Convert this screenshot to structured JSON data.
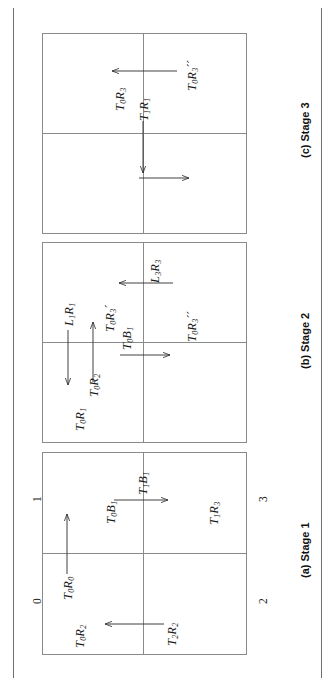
{
  "figure": {
    "type": "quadtree-stage-diagram",
    "orientation": "rotated-90-clockwise",
    "page_rules": 2,
    "panels": [
      {
        "id": "stage1",
        "caption": "(a) Stage 1",
        "quadrant_labels": [
          "0",
          "1",
          "2",
          "3"
        ],
        "cell_labels": [
          {
            "text_parts": [
              "T",
              "0",
              "R",
              "2"
            ],
            "display": "T0R2"
          },
          {
            "text_parts": [
              "T",
              "0",
              "B",
              "1"
            ],
            "display": "T0B1"
          },
          {
            "text_parts": [
              "T",
              "1",
              "R",
              "3"
            ],
            "display": "T1R3"
          }
        ],
        "arrow_labels": [
          {
            "display": "T0R0",
            "direction": "up"
          },
          {
            "display": "T1B1",
            "direction": "right"
          },
          {
            "display": "T2R2",
            "direction": "left"
          }
        ]
      },
      {
        "id": "stage2",
        "caption": "(b) Stage 2",
        "quadrant_labels": [],
        "cell_labels": [
          {
            "display": "T0R1"
          },
          {
            "display": "T0R3'"
          },
          {
            "display": "T0R3''"
          }
        ],
        "arrow_labels": [
          {
            "display": "L1R1",
            "direction": "down"
          },
          {
            "display": "T0R2",
            "direction": "up"
          },
          {
            "display": "T0B1",
            "direction": "right"
          },
          {
            "display": "L3R3",
            "direction": "left"
          }
        ]
      },
      {
        "id": "stage3",
        "caption": "(c) Stage 3",
        "quadrant_labels": [],
        "cell_labels": [
          {
            "display": "T0R3"
          },
          {
            "display": "T0R3''"
          }
        ],
        "arrow_labels": [
          {
            "display": "T1R1",
            "direction": "down-then-right"
          },
          {
            "display": "",
            "direction": "left"
          }
        ]
      }
    ]
  },
  "stage1": {
    "caption": "(a) Stage 1",
    "q0": "0",
    "q1": "1",
    "q2": "2",
    "q3": "3",
    "lbl_T0R2_T": "T",
    "lbl_T0R2_s1": "0",
    "lbl_T0R2_R": "R",
    "lbl_T0R2_s2": "2",
    "lbl_T0B1_T": "T",
    "lbl_T0B1_s1": "0",
    "lbl_T0B1_B": "B",
    "lbl_T0B1_s2": "1",
    "lbl_T1R3_T": "T",
    "lbl_T1R3_s1": "1",
    "lbl_T1R3_R": "R",
    "lbl_T1R3_s2": "3",
    "lbl_T0R0_T": "T",
    "lbl_T0R0_s1": "0",
    "lbl_T0R0_R": "R",
    "lbl_T0R0_s2": "0",
    "lbl_T1B1_T": "T",
    "lbl_T1B1_s1": "1",
    "lbl_T1B1_B": "B",
    "lbl_T1B1_s2": "1",
    "lbl_T2R2_T": "T",
    "lbl_T2R2_s1": "2",
    "lbl_T2R2_R": "R",
    "lbl_T2R2_s2": "2"
  },
  "stage2": {
    "caption": "(b) Stage 2",
    "lbl_T0R1_T": "T",
    "lbl_T0R1_s1": "0",
    "lbl_T0R1_R": "R",
    "lbl_T0R1_s2": "1",
    "lbl_L1R1_L": "L",
    "lbl_L1R1_s1": "1",
    "lbl_L1R1_R": "R",
    "lbl_L1R1_s2": "1",
    "lbl_T0R2_T": "T",
    "lbl_T0R2_s1": "0",
    "lbl_T0R2_R": "R",
    "lbl_T0R2_s2": "2",
    "lbl_T0R3p_T": "T",
    "lbl_T0R3p_s1": "0",
    "lbl_T0R3p_R": "R",
    "lbl_T0R3p_s2": "3",
    "lbl_T0R3p_prime": "´",
    "lbl_T0B1_T": "T",
    "lbl_T0B1_s1": "0",
    "lbl_T0B1_B": "B",
    "lbl_T0B1_s2": "1",
    "lbl_L3R3_L": "L",
    "lbl_L3R3_s1": "3",
    "lbl_L3R3_R": "R",
    "lbl_L3R3_s2": "3",
    "lbl_T0R3pp_T": "T",
    "lbl_T0R3pp_s1": "0",
    "lbl_T0R3pp_R": "R",
    "lbl_T0R3pp_s2": "3",
    "lbl_T0R3pp_prime": "´´"
  },
  "stage3": {
    "caption": "(c) Stage 3",
    "lbl_T0R3_T": "T",
    "lbl_T0R3_s1": "0",
    "lbl_T0R3_R": "R",
    "lbl_T0R3_s2": "3",
    "lbl_T1R1_T": "T",
    "lbl_T1R1_s1": "1",
    "lbl_T1R1_R": "R",
    "lbl_T1R1_s2": "1",
    "lbl_T0R3pp_T": "T",
    "lbl_T0R3pp_s1": "0",
    "lbl_T0R3pp_R": "R",
    "lbl_T0R3pp_s2": "3",
    "lbl_T0R3pp_prime": "´´"
  },
  "colors": {
    "ink": "#1a1a1a",
    "rule": "#8a8a8a",
    "page_rule": "#6f6f6f",
    "background": "#ffffff"
  }
}
